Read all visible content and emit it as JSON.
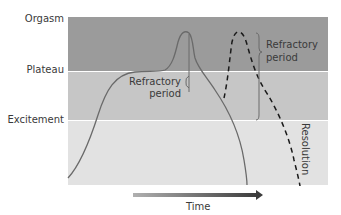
{
  "stages": [
    {
      "label": "Orgasm",
      "color": "#9b9b9b"
    },
    {
      "label": "Plateau",
      "color": "#c6c6c6"
    },
    {
      "label": "Excitement",
      "color": "#e2e2e2"
    }
  ],
  "annotations": {
    "refractory_1_line1": "Refractory",
    "refractory_1_line2": "period",
    "refractory_2_line1": "Refractory",
    "refractory_2_line2": "period",
    "resolution": "Resolution"
  },
  "axis": {
    "x_label": "Time"
  },
  "curves": {
    "solid": {
      "style": "solid",
      "color": "#6a6a6a"
    },
    "dashed": {
      "style": "dashed",
      "color": "#1a1a1a"
    }
  }
}
